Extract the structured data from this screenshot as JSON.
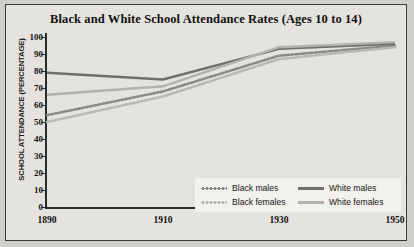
{
  "chart_data": {
    "type": "line",
    "title": "Black and White School Attendance Rates (Ages 10 to 14)",
    "xlabel": "",
    "ylabel": "SCHOOL ATTENDANCE (PERCENTAGE)",
    "x": [
      1890,
      1910,
      1930,
      1950
    ],
    "xticklabels": [
      "1890",
      "1910",
      "1930",
      "1950"
    ],
    "yticklabels": [
      "0",
      "10",
      "20",
      "30",
      "40",
      "50",
      "60",
      "70",
      "80",
      "90",
      "100"
    ],
    "yticks": [
      0,
      10,
      20,
      30,
      40,
      50,
      60,
      70,
      80,
      90,
      100
    ],
    "ylim": [
      0,
      100
    ],
    "xlim": [
      1890,
      1950
    ],
    "grid": false,
    "legend_position": "lower right",
    "series": [
      {
        "name": "Black males",
        "values": [
          54,
          68,
          89,
          95
        ],
        "style": "dotted",
        "color": "#8a8a87"
      },
      {
        "name": "Black females",
        "values": [
          50,
          65,
          87,
          94
        ],
        "style": "dotted",
        "color": "#b9b8b4"
      },
      {
        "name": "White males",
        "values": [
          79,
          75,
          93,
          96
        ],
        "style": "solid",
        "color": "#6f6f6d"
      },
      {
        "name": "White females",
        "values": [
          66,
          71,
          94,
          97
        ],
        "style": "solid",
        "color": "#b3b2ae"
      }
    ]
  },
  "legend": {
    "black_males": "Black males",
    "black_females": "Black females",
    "white_males": "White males",
    "white_females": "White females"
  },
  "colors": {
    "background": "#e4e3df",
    "page": "#cfcfcc",
    "frame": "#3a3a38",
    "axis": "#2a2a28",
    "text": "#12110f",
    "legend_background": "#f2f1ee"
  }
}
